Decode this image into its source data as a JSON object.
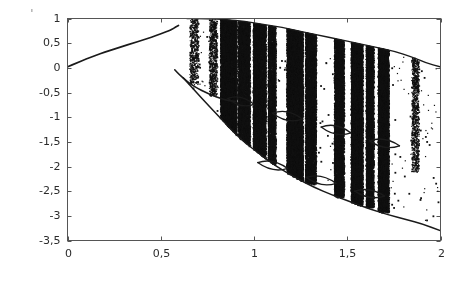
{
  "figure": {
    "artifact_mark": "·"
  },
  "chart_data": {
    "type": "scatter",
    "title": "",
    "subtitle": "",
    "xlabel": "A",
    "ylabel": "ζ",
    "xlim": [
      0,
      2
    ],
    "ylim": [
      -3.5,
      1
    ],
    "grid": false,
    "legend": null,
    "style": {
      "point_color": "#111111",
      "curve_color": "#1a1a1a",
      "axis_color": "#555555",
      "background": "#ffffff"
    },
    "xticks": [
      0,
      0.5,
      1,
      1.5,
      2
    ],
    "xtick_labels": [
      "0",
      "0,5",
      "1",
      "1,5",
      "2"
    ],
    "yticks": [
      1,
      0.5,
      0,
      -0.5,
      -1,
      -1.5,
      -2,
      -2.5,
      -3,
      -3.5
    ],
    "ytick_labels": [
      "1",
      "0,5",
      "0",
      "-0,5",
      "-1",
      "-1,5",
      "-2",
      "-2,5",
      "-3",
      "-3,5"
    ],
    "branches": {
      "upper_stable": {
        "name": "upper stable branch",
        "x": [
          0.0,
          0.05,
          0.1,
          0.15,
          0.2,
          0.25,
          0.3,
          0.35,
          0.4,
          0.45,
          0.5,
          0.53,
          0.55,
          0.57,
          0.58,
          0.59,
          0.595
        ],
        "y": [
          0.02,
          0.1,
          0.18,
          0.25,
          0.32,
          0.38,
          0.44,
          0.5,
          0.56,
          0.62,
          0.69,
          0.73,
          0.76,
          0.8,
          0.83,
          0.85,
          0.86
        ]
      },
      "lower_branch": {
        "name": "lower descending branch",
        "x": [
          0.575,
          0.6,
          0.63,
          0.66,
          0.7,
          0.74,
          0.78,
          0.82,
          0.86,
          0.9
        ],
        "y": [
          -0.04,
          -0.14,
          -0.24,
          -0.33,
          -0.42,
          -0.5,
          -0.56,
          -0.62,
          -0.66,
          -0.68
        ]
      },
      "upper_envelope": {
        "name": "chaotic upper envelope",
        "x": [
          0.64,
          0.75,
          0.85,
          0.95,
          1.05,
          1.15,
          1.25,
          1.35,
          1.45,
          1.55,
          1.65,
          1.75,
          1.85,
          1.92,
          2.0
        ],
        "y": [
          1.0,
          1.0,
          0.98,
          0.94,
          0.88,
          0.82,
          0.74,
          0.66,
          0.58,
          0.5,
          0.42,
          0.34,
          0.22,
          0.1,
          0.02
        ]
      },
      "lower_envelope": {
        "name": "chaotic lower envelope",
        "x": [
          0.62,
          0.72,
          0.82,
          0.92,
          1.02,
          1.12,
          1.22,
          1.32,
          1.42,
          1.52,
          1.62,
          1.72,
          1.82,
          1.9,
          2.0
        ],
        "y": [
          -0.2,
          -0.62,
          -1.02,
          -1.42,
          -1.72,
          -2.0,
          -2.22,
          -2.42,
          -2.58,
          -2.72,
          -2.86,
          -2.98,
          -3.08,
          -3.16,
          -3.3
        ]
      },
      "period_arcs": {
        "name": "periodic window arcs",
        "arcs": [
          {
            "x0": 0.86,
            "x1": 1.0,
            "y0": -0.62,
            "y1": -0.74,
            "sag": 0.16
          },
          {
            "x0": 1.1,
            "x1": 1.26,
            "y0": -0.92,
            "y1": -1.04,
            "sag": 0.17
          },
          {
            "x0": 1.36,
            "x1": 1.52,
            "y0": -1.2,
            "y1": -1.32,
            "sag": 0.17
          },
          {
            "x0": 1.62,
            "x1": 1.78,
            "y0": -1.48,
            "y1": -1.58,
            "sag": 0.16
          },
          {
            "x0": 1.02,
            "x1": 1.18,
            "y0": -1.92,
            "y1": -2.04,
            "sag": 0.16
          },
          {
            "x0": 1.28,
            "x1": 1.44,
            "y0": -2.22,
            "y1": -2.34,
            "sag": 0.16
          },
          {
            "x0": 1.54,
            "x1": 1.7,
            "y0": -2.5,
            "y1": -2.6,
            "sag": 0.15
          }
        ]
      }
    },
    "chaotic_bands": [
      {
        "x0": 0.655,
        "x1": 0.7,
        "ytop": 1.0,
        "ybot": -0.3,
        "density": 0.22
      },
      {
        "x0": 0.76,
        "x1": 0.8,
        "ytop": 1.0,
        "ybot": -0.55,
        "density": 0.3
      },
      {
        "x0": 0.82,
        "x1": 0.905,
        "ytop": 1.0,
        "ybot": -1.75,
        "density": 0.86
      },
      {
        "x0": 0.915,
        "x1": 0.975,
        "ytop": 0.97,
        "ybot": -1.62,
        "density": 0.72
      },
      {
        "x0": 0.995,
        "x1": 1.06,
        "ytop": 0.93,
        "ybot": -1.85,
        "density": 0.8
      },
      {
        "x0": 1.075,
        "x1": 1.115,
        "ytop": 0.9,
        "ybot": -1.95,
        "density": 0.62
      },
      {
        "x0": 1.175,
        "x1": 1.26,
        "ytop": 0.82,
        "ybot": -2.3,
        "density": 0.9
      },
      {
        "x0": 1.275,
        "x1": 1.33,
        "ytop": 0.76,
        "ybot": -2.35,
        "density": 0.74
      },
      {
        "x0": 1.43,
        "x1": 1.48,
        "ytop": 0.6,
        "ybot": -2.62,
        "density": 0.7
      },
      {
        "x0": 1.52,
        "x1": 1.58,
        "ytop": 0.54,
        "ybot": -2.78,
        "density": 0.88
      },
      {
        "x0": 1.6,
        "x1": 1.64,
        "ytop": 0.48,
        "ybot": -2.82,
        "density": 0.74
      },
      {
        "x0": 1.665,
        "x1": 1.72,
        "ytop": 0.44,
        "ybot": -2.92,
        "density": 0.84
      },
      {
        "x0": 1.845,
        "x1": 1.88,
        "ytop": 0.3,
        "ybot": -2.1,
        "density": 0.26
      }
    ],
    "sparse_clusters": [
      {
        "x0": 0.7,
        "x1": 0.76,
        "ytop": 0.95,
        "ybot": -0.1,
        "density": 0.05
      },
      {
        "x0": 0.64,
        "x1": 0.82,
        "ytop": 0.3,
        "ybot": -1.55,
        "density": 0.025
      },
      {
        "x0": 1.12,
        "x1": 1.175,
        "ytop": 0.2,
        "ybot": -1.2,
        "density": 0.03
      },
      {
        "x0": 1.34,
        "x1": 1.43,
        "ytop": 0.45,
        "ybot": -2.3,
        "density": 0.03
      },
      {
        "x0": 1.73,
        "x1": 1.845,
        "ytop": 0.3,
        "ybot": -2.9,
        "density": 0.03
      },
      {
        "x0": 1.88,
        "x1": 1.985,
        "ytop": 0.22,
        "ybot": -3.1,
        "density": 0.035
      }
    ]
  }
}
